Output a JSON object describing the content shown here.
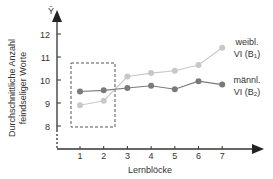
{
  "chart_data": {
    "type": "line",
    "title": "",
    "xlabel": "Lernblöcke",
    "ylabel_line1": "Durchschnittliche Anzahl",
    "ylabel_line2": "feindseliger Worte",
    "y_axis_symbol": "Ȳ",
    "x": [
      1,
      2,
      3,
      4,
      5,
      6,
      7
    ],
    "x_ticks": [
      "1",
      "2",
      "3",
      "4",
      "5",
      "6",
      "7"
    ],
    "y_ticks": [
      "8",
      "9",
      "10",
      "11",
      "12"
    ],
    "ylim": [
      8,
      12
    ],
    "grid": false,
    "legend_position": "right, inline labels",
    "series": [
      {
        "name": "weibl. VI (B1)",
        "label_line1": "weibl.",
        "label_line2": "VI (B",
        "sub": "1",
        "label_end": ")",
        "color": "#c8c8c8",
        "values": [
          8.9,
          9.1,
          10.15,
          10.3,
          10.4,
          10.65,
          11.4
        ]
      },
      {
        "name": "männl. VI (B2)",
        "label_line1": "männl.",
        "label_line2": "VI (B",
        "sub": "2",
        "label_end": ")",
        "color": "#7a7a7a",
        "values": [
          9.5,
          9.55,
          9.65,
          9.75,
          9.6,
          9.95,
          9.8
        ]
      }
    ],
    "annotations": [
      {
        "type": "dashed-rectangle",
        "x_range": [
          0.6,
          2.45
        ],
        "y_range": [
          8.0,
          10.75
        ],
        "description": "highlights Lernblöcke 1–2"
      }
    ]
  }
}
